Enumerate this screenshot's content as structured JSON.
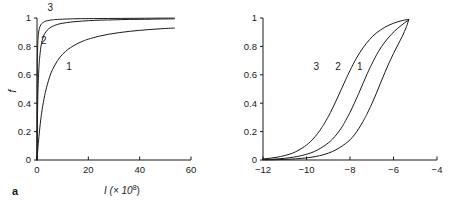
{
  "figure": {
    "panel_a_letter": "a",
    "panel_b_letter": "b"
  },
  "chart_data": [
    {
      "type": "line",
      "panel": "a",
      "title": "",
      "xlabel": "I (× 10⁸)",
      "xlabel_base": "I (× 10",
      "xlabel_exponent": "8",
      "xlabel_close": ")",
      "ylabel": "f",
      "xlim": [
        0,
        60
      ],
      "ylim": [
        0,
        1
      ],
      "xticks": [
        0,
        20,
        40,
        60
      ],
      "xticklabels": [
        "0",
        "20",
        "40",
        "60"
      ],
      "yticks": [
        0,
        0.2,
        0.4,
        0.6,
        0.8,
        1
      ],
      "yticklabels": [
        "0",
        "0.2",
        "0.4",
        "0.6",
        "0.8",
        "1"
      ],
      "grid": false,
      "legend": "inline-curve-labels",
      "series": [
        {
          "name": "1",
          "label": "1",
          "label_x": 12.5,
          "label_y": 0.655,
          "x": [
            0,
            0.5,
            1,
            1.5,
            2,
            3,
            4,
            5,
            6,
            8,
            10,
            12,
            14,
            16,
            18,
            20,
            24,
            28,
            32,
            36,
            40,
            44,
            48,
            52,
            53.5
          ],
          "y": [
            0,
            0.115,
            0.21,
            0.29,
            0.355,
            0.455,
            0.53,
            0.59,
            0.635,
            0.7,
            0.745,
            0.778,
            0.802,
            0.822,
            0.838,
            0.851,
            0.871,
            0.886,
            0.897,
            0.906,
            0.913,
            0.919,
            0.924,
            0.928,
            0.929
          ]
        },
        {
          "name": "2",
          "label": "2",
          "label_x": 2.6,
          "label_y": 0.845,
          "x": [
            0,
            0.2,
            0.4,
            0.6,
            0.8,
            1,
            1.5,
            2,
            2.5,
            3,
            4,
            5,
            6,
            8,
            10,
            13,
            16,
            20,
            25,
            30,
            36,
            42,
            48,
            53.5
          ],
          "y": [
            0,
            0.32,
            0.5,
            0.6,
            0.665,
            0.715,
            0.795,
            0.84,
            0.87,
            0.89,
            0.915,
            0.93,
            0.941,
            0.955,
            0.963,
            0.971,
            0.976,
            0.981,
            0.985,
            0.987,
            0.99,
            0.991,
            0.993,
            0.994
          ]
        },
        {
          "name": "3",
          "label": "3",
          "label_x": 5.2,
          "label_y": 1.075,
          "x": [
            0,
            0.05,
            0.1,
            0.15,
            0.2,
            0.3,
            0.4,
            0.5,
            0.7,
            0.9,
            1.2,
            1.6,
            2,
            3,
            4,
            6,
            8,
            12,
            16,
            22,
            30,
            40,
            48,
            53.5
          ],
          "y": [
            0,
            0.45,
            0.62,
            0.705,
            0.755,
            0.82,
            0.855,
            0.878,
            0.908,
            0.925,
            0.942,
            0.955,
            0.963,
            0.975,
            0.981,
            0.987,
            0.99,
            0.993,
            0.995,
            0.996,
            0.997,
            0.998,
            0.999,
            0.999
          ]
        }
      ]
    },
    {
      "type": "line",
      "panel": "b",
      "title": "",
      "xlabel": "log I",
      "xlabel_base": "log ",
      "xlabel_italic": "I",
      "ylabel": "f",
      "xlim": [
        -12,
        -4
      ],
      "ylim": [
        0,
        1
      ],
      "xticks": [
        -12,
        -10,
        -8,
        -6,
        -4
      ],
      "xticklabels": [
        "−12",
        "−10",
        "−8",
        "−6",
        "−4"
      ],
      "yticks": [
        0,
        0.2,
        0.4,
        0.6,
        0.8,
        1
      ],
      "yticklabels": [
        "0",
        "0.2",
        "0.4",
        "0.6",
        "0.8",
        "1"
      ],
      "grid": false,
      "legend": "inline-curve-labels",
      "series": [
        {
          "name": "1",
          "label": "1",
          "label_x": -7.55,
          "label_y": 0.655,
          "midpoint": -7.3,
          "x": [
            -12,
            -11.5,
            -11,
            -10.5,
            -10,
            -9.6,
            -9.2,
            -8.8,
            -8.5,
            -8.2,
            -8,
            -7.8,
            -7.6,
            -7.4,
            -7.3,
            -7.2,
            -7,
            -6.8,
            -6.6,
            -6.4,
            -6.2,
            -6,
            -5.8,
            -5.6,
            -5.4,
            -5.3
          ],
          "y": [
            0.001,
            0.002,
            0.004,
            0.008,
            0.015,
            0.024,
            0.038,
            0.06,
            0.085,
            0.116,
            0.142,
            0.177,
            0.22,
            0.272,
            0.3,
            0.33,
            0.395,
            0.465,
            0.54,
            0.615,
            0.685,
            0.75,
            0.81,
            0.87,
            0.94,
            0.99
          ]
        },
        {
          "name": "2",
          "label": "2",
          "label_x": -8.55,
          "label_y": 0.655,
          "midpoint": -8.3,
          "x": [
            -12,
            -11.5,
            -11,
            -10.6,
            -10.2,
            -9.8,
            -9.5,
            -9.2,
            -9,
            -8.8,
            -8.6,
            -8.4,
            -8.3,
            -8.2,
            -8,
            -7.8,
            -7.6,
            -7.4,
            -7.2,
            -7,
            -6.7,
            -6.4,
            -6.1,
            -5.8,
            -5.5,
            -5.3
          ],
          "y": [
            0.003,
            0.006,
            0.012,
            0.02,
            0.032,
            0.05,
            0.07,
            0.098,
            0.12,
            0.148,
            0.183,
            0.225,
            0.25,
            0.278,
            0.335,
            0.4,
            0.468,
            0.54,
            0.61,
            0.675,
            0.762,
            0.83,
            0.885,
            0.928,
            0.965,
            0.985
          ]
        },
        {
          "name": "3",
          "label": "3",
          "label_x": -9.55,
          "label_y": 0.655,
          "midpoint": -9.3,
          "x": [
            -12,
            -11.6,
            -11.2,
            -10.8,
            -10.5,
            -10.2,
            -10,
            -9.8,
            -9.6,
            -9.4,
            -9.3,
            -9.2,
            -9,
            -8.8,
            -8.6,
            -8.4,
            -8.2,
            -8,
            -7.7,
            -7.4,
            -7.1,
            -6.8,
            -6.4,
            -6,
            -5.6,
            -5.3
          ],
          "y": [
            0.008,
            0.014,
            0.024,
            0.04,
            0.058,
            0.084,
            0.105,
            0.132,
            0.165,
            0.205,
            0.228,
            0.252,
            0.305,
            0.365,
            0.43,
            0.497,
            0.565,
            0.63,
            0.718,
            0.79,
            0.848,
            0.893,
            0.935,
            0.963,
            0.982,
            0.99
          ]
        }
      ]
    }
  ]
}
